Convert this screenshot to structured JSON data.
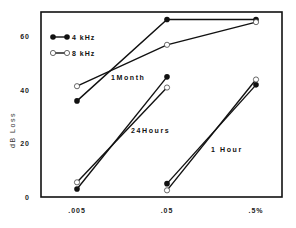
{
  "chart_data": {
    "type": "line",
    "title": "",
    "xlabel": "",
    "ylabel": "dB Loss",
    "ylim": [
      0,
      70
    ],
    "yticks": [
      0,
      20,
      40,
      60
    ],
    "ytick_labels": [
      "0",
      "20",
      "40",
      "60"
    ],
    "categories": [
      ".005",
      ".05",
      ".5%"
    ],
    "grid": false,
    "legend_position": "upper-left-inside",
    "legend": [
      {
        "name": "4 kHz",
        "marker": "filled-circle"
      },
      {
        "name": "8 kHz",
        "marker": "open-circle"
      }
    ],
    "groups": [
      {
        "label": "1Month",
        "x_categories": [
          ".005",
          ".05",
          ".5%"
        ],
        "series": [
          {
            "name": "4 kHz",
            "values": [
              36,
              66.5,
              66.5
            ]
          },
          {
            "name": "8 kHz",
            "values": [
              41.5,
              57,
              65.5
            ]
          }
        ]
      },
      {
        "label": "24Hours",
        "x_categories": [
          ".005",
          ".05"
        ],
        "series": [
          {
            "name": "4 kHz",
            "values": [
              3,
              45
            ]
          },
          {
            "name": "8 kHz",
            "values": [
              5.5,
              41
            ]
          }
        ]
      },
      {
        "label": "1 Hour",
        "x_categories": [
          ".05",
          ".5%"
        ],
        "series": [
          {
            "name": "4 kHz",
            "values": [
              5,
              42
            ]
          },
          {
            "name": "8 kHz",
            "values": [
              2.5,
              44
            ]
          }
        ]
      }
    ],
    "annotations": [
      {
        "text": "1Month",
        "near": "1 Month lines between .005 and .05"
      },
      {
        "text": "24Hours",
        "near": "24 Hours lines between .005 and .05"
      },
      {
        "text": "1 Hour",
        "near": "1 Hour lines between .05 and .5%"
      }
    ]
  }
}
